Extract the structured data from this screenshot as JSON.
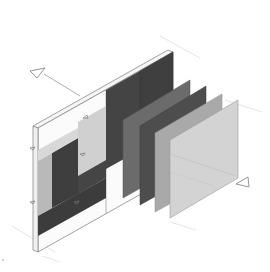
{
  "diagram": {
    "type": "exploded-axonometric-wall-assembly",
    "background": "#ffffff",
    "line_color": "#8a8a8a",
    "guide_color": "#e4e4e4",
    "section_markers": [
      {
        "name": "section-marker-top-left",
        "points": "30,72 45,68 38,78"
      },
      {
        "name": "section-marker-bottom-right",
        "points": "247,183 262,185 253,176"
      }
    ],
    "base_wall": {
      "fill": "#fafafa",
      "stroke": "#8a8a8a",
      "inset_panels": [
        {
          "name": "inset-light-left",
          "fill": "#b9b9b9"
        },
        {
          "name": "inset-dark-left",
          "fill": "#3e3e3e"
        },
        {
          "name": "inset-mid",
          "fill": "#4a4a4a"
        },
        {
          "name": "inset-light-center",
          "fill": "#d0d0d0"
        },
        {
          "name": "inset-dark-right",
          "fill": "#444444"
        }
      ]
    },
    "layers": [
      {
        "name": "layer-1",
        "fill": "#3f3f3f"
      },
      {
        "name": "layer-2",
        "fill": "#6b6b6b"
      },
      {
        "name": "layer-3",
        "fill": "#4d4d4d"
      },
      {
        "name": "layer-4",
        "fill": "#a9a9a9"
      },
      {
        "name": "layer-5",
        "fill": "#d3d3d3"
      }
    ]
  }
}
